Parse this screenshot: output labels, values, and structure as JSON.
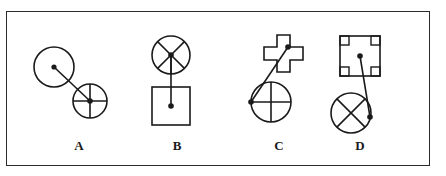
{
  "panel": {
    "border_color": "#2b2b2b",
    "background_color": "#ffffff",
    "stroke_color": "#1a1a1a"
  },
  "figures": [
    {
      "id": "A",
      "label": "A",
      "description": "Plain circle with center dot joined by a straight line to a smaller circle divided by vertical and horizontal cross lines with a center dot.",
      "nodes": [
        {
          "name": "plain-circle",
          "shape": "circle",
          "cx": 55,
          "cy": 63,
          "r": 20,
          "marking": "none",
          "dot": {
            "x": 55,
            "y": 63
          }
        },
        {
          "name": "cross-circle",
          "shape": "circle",
          "cx": 91,
          "cy": 97,
          "r": 17,
          "marking": "plus-cross",
          "dot": {
            "x": 91,
            "y": 97
          }
        }
      ],
      "connector": {
        "x1": 55,
        "y1": 63,
        "x2": 91,
        "y2": 97
      }
    },
    {
      "id": "B",
      "label": "B",
      "description": "Circle with X cross plus a downward spoke, connected by a vertical line to a square with a center dot.",
      "nodes": [
        {
          "name": "spoked-circle",
          "shape": "circle",
          "cx": 172,
          "cy": 51,
          "r": 19,
          "marking": "x-cross-with-down-spoke",
          "dot": {
            "x": 172,
            "y": 51
          }
        },
        {
          "name": "square",
          "shape": "square",
          "cx": 172,
          "cy": 102,
          "size": 38,
          "marking": "none",
          "dot": {
            "x": 172,
            "y": 102
          }
        }
      ],
      "connector": {
        "x1": 172,
        "y1": 51,
        "x2": 172,
        "y2": 102
      }
    },
    {
      "id": "C",
      "label": "C",
      "description": "Outlined plus/cross polygon joined by a diagonal line to a circle divided by vertical and horizontal cross lines; dots sit on the cross arm and on the circle edge.",
      "nodes": [
        {
          "name": "plus-polygon",
          "shape": "plus",
          "cx": 272,
          "cy": 56,
          "size": 38,
          "arm": 13,
          "marking": "none",
          "dot": {
            "x": 288,
            "y": 43
          }
        },
        {
          "name": "cross-circle",
          "shape": "circle",
          "cx": 272,
          "cy": 98,
          "r": 20,
          "marking": "plus-cross",
          "dot": {
            "x": 252,
            "y": 98
          }
        }
      ],
      "connector": {
        "x1": 288,
        "y1": 43,
        "x2": 252,
        "y2": 98
      }
    },
    {
      "id": "D",
      "label": "D",
      "description": "Square with small square marks in all four inner corners and a center dot, joined by a line to a circle marked with an X cross; the dot sits on the circle edge.",
      "nodes": [
        {
          "name": "corner-marked-square",
          "shape": "square",
          "cx": 361,
          "cy": 52,
          "size": 40,
          "marking": "corner-squares",
          "dot": {
            "x": 361,
            "y": 52
          }
        },
        {
          "name": "x-cross-circle",
          "shape": "circle",
          "cx": 352,
          "cy": 109,
          "r": 20,
          "marking": "x-cross",
          "dot": {
            "x": 371,
            "y": 113
          }
        }
      ],
      "connector": {
        "x1": 361,
        "y1": 52,
        "x2": 371,
        "y2": 113
      }
    }
  ]
}
